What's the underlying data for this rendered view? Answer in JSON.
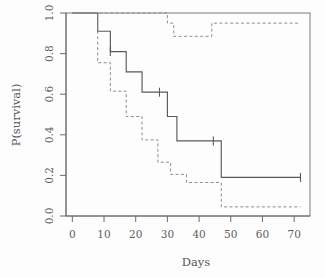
{
  "chart_data": {
    "type": "line",
    "title": "",
    "subtitle": "",
    "xlabel": "Days",
    "ylabel": "P(survival)",
    "xlim": [
      -2,
      75
    ],
    "ylim": [
      0.0,
      1.0
    ],
    "xticks": [
      0,
      10,
      20,
      30,
      40,
      50,
      60,
      70
    ],
    "xtick_labels": [
      "0",
      "10",
      "20",
      "30",
      "40",
      "50",
      "60",
      "70"
    ],
    "yticks": [
      0.0,
      0.2,
      0.4,
      0.6,
      0.8,
      1.0
    ],
    "ytick_labels": [
      "0.0",
      "0.2",
      "0.4",
      "0.6",
      "0.8",
      "1.0"
    ],
    "grid": false,
    "legend": null,
    "legend_position": "none",
    "plot_style": "kaplan-meier step survival curve with dashed confidence bands",
    "series": [
      {
        "name": "survival estimate",
        "style": "solid",
        "step": "post",
        "x": [
          0,
          8,
          8,
          12,
          12,
          17,
          17,
          22,
          22,
          30,
          30,
          33,
          33,
          47,
          47,
          72
        ],
        "y": [
          1.0,
          1.0,
          0.91,
          0.91,
          0.81,
          0.81,
          0.71,
          0.71,
          0.61,
          0.61,
          0.49,
          0.49,
          0.37,
          0.37,
          0.19,
          0.19
        ]
      },
      {
        "name": "upper confidence limit",
        "style": "dashed",
        "step": "post",
        "x": [
          0,
          8,
          8,
          30,
          30,
          32,
          32,
          44,
          44,
          72
        ],
        "y": [
          1.0,
          1.0,
          1.0,
          1.0,
          0.95,
          0.95,
          0.885,
          0.885,
          0.95,
          0.95
        ]
      },
      {
        "name": "lower confidence limit",
        "style": "dashed",
        "step": "post",
        "x": [
          0,
          8,
          8,
          12,
          12,
          17,
          17,
          22,
          22,
          27,
          27,
          31,
          31,
          36,
          36,
          47,
          47,
          72
        ],
        "y": [
          1.0,
          1.0,
          0.755,
          0.755,
          0.615,
          0.615,
          0.49,
          0.49,
          0.375,
          0.375,
          0.265,
          0.265,
          0.205,
          0.205,
          0.165,
          0.165,
          0.045,
          0.045
        ]
      }
    ],
    "censoring_marks": [
      {
        "x": 12,
        "y": 0.81
      },
      {
        "x": 27.5,
        "y": 0.61
      },
      {
        "x": 44.5,
        "y": 0.37
      },
      {
        "x": 72,
        "y": 0.19
      }
    ]
  }
}
